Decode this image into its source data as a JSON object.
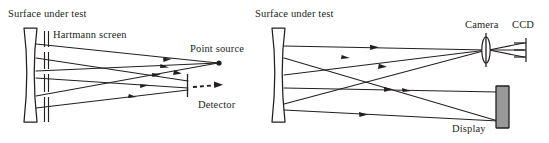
{
  "figure": {
    "type": "optical-diagram",
    "width": 549,
    "height": 143,
    "background_color": "#ffffff",
    "ink_color": "#231f20",
    "display_fill_color": "#999999"
  },
  "panels": [
    {
      "id": "left",
      "name": "hartmann-screen-test",
      "labels": {
        "surface": "Surface under test",
        "screen": "Hartmann screen",
        "source": "Point source",
        "detector": "Detector"
      },
      "components": [
        {
          "name": "concave-mirror",
          "icon": "concave-mirror-icon"
        },
        {
          "name": "hartmann-screen",
          "icon": "slit-screen-icon"
        },
        {
          "name": "point-source",
          "icon": "point-source-icon"
        },
        {
          "name": "detector",
          "icon": "detector-plate-icon"
        }
      ],
      "ray_count_incoming": 3,
      "ray_count_outgoing": 3,
      "dashed_ray": true
    },
    {
      "id": "right",
      "name": "display-camera-test",
      "labels": {
        "surface": "Surface under test",
        "camera": "Camera",
        "ccd": "CCD",
        "display": "Display"
      },
      "components": [
        {
          "name": "concave-mirror",
          "icon": "concave-mirror-icon"
        },
        {
          "name": "camera-lens",
          "icon": "lens-icon"
        },
        {
          "name": "ccd-sensor",
          "icon": "ccd-icon"
        },
        {
          "name": "display-panel",
          "icon": "display-panel-icon"
        }
      ],
      "ray_count_to_camera": 3,
      "ray_count_from_display": 3
    }
  ]
}
